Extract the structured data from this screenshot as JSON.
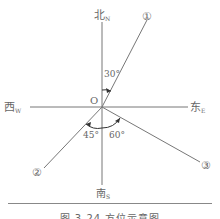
{
  "diagram": {
    "origin_label": "O",
    "north": {
      "main": "北",
      "sub": "N"
    },
    "south": {
      "main": "南",
      "sub": "S"
    },
    "west": {
      "main": "西",
      "sub": "W"
    },
    "east": {
      "main": "东",
      "sub": "E"
    },
    "rays": [
      {
        "label": "①",
        "angle_label": "30°",
        "description": "North 30° East"
      },
      {
        "label": "②",
        "angle_label": "45°",
        "description": "South 45° West"
      },
      {
        "label": "③",
        "angle_label": "60°",
        "description": "South 60° East"
      }
    ],
    "caption": "图 3.24 方位示意图"
  }
}
